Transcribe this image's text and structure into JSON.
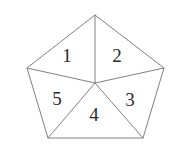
{
  "figure": {
    "name": "pentagon-five-triangles",
    "background_color": "#ffffff",
    "stroke_color": "#808080",
    "label_color": "#2b2b2b",
    "stroke_width": 1,
    "canvas": {
      "width": 172,
      "height": 158
    }
  },
  "shape": {
    "type": "pentagon",
    "sides": 5,
    "center": {
      "x": 95,
      "y": 83
    },
    "vertices": [
      {
        "name": "apex-top",
        "x": 95,
        "y": 15
      },
      {
        "name": "right-upper",
        "x": 164,
        "y": 68
      },
      {
        "name": "right-lower",
        "x": 143,
        "y": 138
      },
      {
        "name": "left-lower",
        "x": 48,
        "y": 138
      },
      {
        "name": "left-upper",
        "x": 27,
        "y": 68
      }
    ],
    "outline_points": "95,15 164,68 143,138 48,138 27,68",
    "spokes": [
      {
        "name": "spoke-to-apex-top",
        "x1": 95,
        "y1": 83,
        "x2": 95,
        "y2": 15
      },
      {
        "name": "spoke-to-right-upper",
        "x1": 95,
        "y1": 83,
        "x2": 164,
        "y2": 68
      },
      {
        "name": "spoke-to-right-lower",
        "x1": 95,
        "y1": 83,
        "x2": 143,
        "y2": 138
      },
      {
        "name": "spoke-to-left-lower",
        "x1": 95,
        "y1": 83,
        "x2": 48,
        "y2": 138
      },
      {
        "name": "spoke-to-left-upper",
        "x1": 95,
        "y1": 83,
        "x2": 27,
        "y2": 68
      }
    ]
  },
  "regions": [
    {
      "id": "region-1",
      "label": "1",
      "x": 67,
      "y": 55,
      "position": "upper-left"
    },
    {
      "id": "region-2",
      "label": "2",
      "x": 117,
      "y": 55,
      "position": "upper-right"
    },
    {
      "id": "region-3",
      "label": "3",
      "x": 130,
      "y": 99,
      "position": "right"
    },
    {
      "id": "region-4",
      "label": "4",
      "x": 94,
      "y": 114,
      "position": "bottom"
    },
    {
      "id": "region-5",
      "label": "5",
      "x": 57,
      "y": 98,
      "position": "left"
    }
  ]
}
